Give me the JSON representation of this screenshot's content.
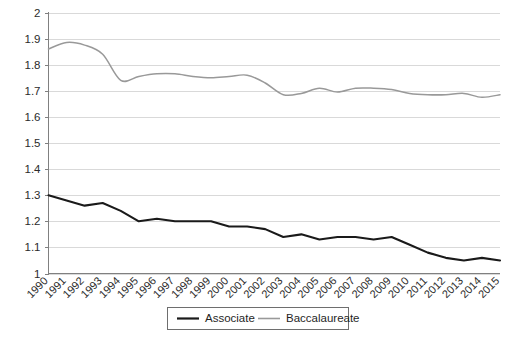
{
  "chart_data": {
    "type": "line",
    "title": "",
    "subtitle": "",
    "xlabel": "",
    "ylabel": "",
    "categories": [
      "1990",
      "1991",
      "1992",
      "1993",
      "1994",
      "1995",
      "1996",
      "1997",
      "1998",
      "1999",
      "2000",
      "2001",
      "2002",
      "2003",
      "2004",
      "2005",
      "2006",
      "2007",
      "2008",
      "2009",
      "2010",
      "2011",
      "2012",
      "2013",
      "2014",
      "2015"
    ],
    "ylim": [
      1,
      2
    ],
    "ytick_labels": [
      "1",
      "1.1",
      "1.2",
      "1.3",
      "1.4",
      "1.5",
      "1.6",
      "1.7",
      "1.8",
      "1.9",
      "2"
    ],
    "ytick_values": [
      1,
      1.1,
      1.2,
      1.3,
      1.4,
      1.5,
      1.6,
      1.7,
      1.8,
      1.9,
      2
    ],
    "grid": true,
    "grid_axis": "y",
    "legend_position": "bottom",
    "series": [
      {
        "name": "Associate",
        "color": "#1a1a1a",
        "values": [
          1.3,
          1.28,
          1.26,
          1.27,
          1.24,
          1.2,
          1.21,
          1.2,
          1.2,
          1.2,
          1.18,
          1.18,
          1.17,
          1.14,
          1.15,
          1.13,
          1.14,
          1.14,
          1.13,
          1.14,
          1.11,
          1.08,
          1.06,
          1.05,
          1.06,
          1.05
        ]
      },
      {
        "name": "Baccalaureate",
        "color": "#999999",
        "values": [
          1.86,
          1.885,
          1.875,
          1.84,
          1.74,
          1.755,
          1.765,
          1.765,
          1.755,
          1.75,
          1.755,
          1.76,
          1.73,
          1.685,
          1.69,
          1.71,
          1.695,
          1.71,
          1.71,
          1.705,
          1.69,
          1.685,
          1.685,
          1.69,
          1.675,
          1.685
        ]
      }
    ]
  },
  "legend": {
    "items": [
      {
        "label": "Associate",
        "color": "#1a1a1a"
      },
      {
        "label": "Baccalaureate",
        "color": "#999999"
      }
    ]
  },
  "colors": {
    "associate": "#1a1a1a",
    "baccalaureate": "#999999",
    "grid": "#d9d9d9",
    "axis": "#808080",
    "background": "#ffffff"
  }
}
